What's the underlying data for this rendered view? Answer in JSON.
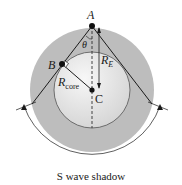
{
  "diagram": {
    "points": {
      "A": "A",
      "B": "B",
      "C": "C"
    },
    "angle_label": "θ",
    "radius_earth": {
      "main": "R",
      "sub": "E"
    },
    "radius_core": {
      "main": "R",
      "sub": "core"
    },
    "caption": "S wave shadow",
    "colors": {
      "mantle": "#b9b9b9",
      "core_light": "#f2f2f2",
      "core_dark": "#d6d6d6",
      "lines": "#1a1a1a"
    }
  }
}
